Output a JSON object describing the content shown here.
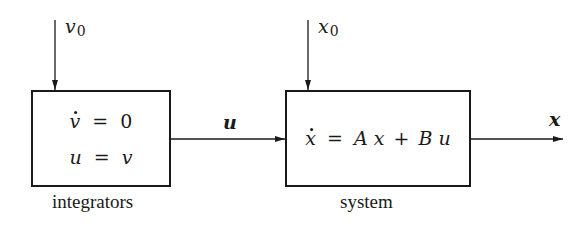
{
  "diagram": {
    "type": "block-diagram",
    "blocks": [
      {
        "id": "integrators",
        "caption": "integrators",
        "equations": [
          {
            "lhs_var": "v",
            "lhs_dot": true,
            "op": "=",
            "rhs": "0"
          },
          {
            "lhs_var": "u",
            "lhs_dot": false,
            "op": "=",
            "rhs_var": "v"
          }
        ],
        "input_label": {
          "var": "v",
          "sub": "0"
        }
      },
      {
        "id": "system",
        "caption": "system",
        "equation": {
          "lhs_var": "x",
          "lhs_dot": true,
          "op": "=",
          "terms": [
            "A",
            "x",
            "+",
            "B",
            "u"
          ]
        },
        "input_label": {
          "var": "x",
          "sub": "0"
        }
      }
    ],
    "edges": [
      {
        "from": "v0",
        "to": "integrators",
        "label": "v0"
      },
      {
        "from": "integrators",
        "to": "system",
        "label": "u"
      },
      {
        "from": "x0",
        "to": "system",
        "label": "x0"
      },
      {
        "from": "system",
        "to": "output",
        "label": "x"
      }
    ],
    "signals": {
      "connector_label": "u",
      "output_label": "x"
    },
    "colors": {
      "stroke": "#1a1a1a",
      "background": "#ffffff"
    }
  }
}
